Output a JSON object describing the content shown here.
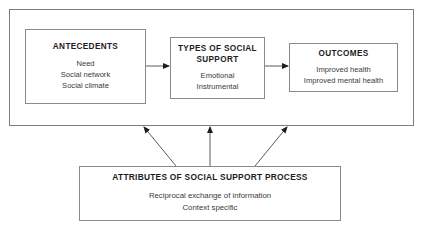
{
  "diagram": {
    "line_color": "#8a8a8a",
    "text_color": "#2b2b2b",
    "background": "#ffffff",
    "outer_container": {
      "label": "outer-frame"
    },
    "boxes": [
      {
        "id": "antecedents",
        "title": "ANTECEDENTS",
        "lines": [
          "Need",
          "Social network",
          "Social climate"
        ]
      },
      {
        "id": "types-of-social-support",
        "title": "TYPES OF SOCIAL SUPPORT",
        "title_line1": "TYPES OF SOCIAL",
        "title_line2": "SUPPORT",
        "lines": [
          "Emotional",
          "Instrumental"
        ]
      },
      {
        "id": "outcomes",
        "title": "OUTCOMES",
        "lines": [
          "Improved health",
          "Improved mental health"
        ]
      },
      {
        "id": "attributes-of-social-support-process",
        "title": "ATTRIBUTES OF SOCIAL SUPPORT PROCESS",
        "lines": [
          "Reciprocal exchange of information",
          "Context specific"
        ]
      }
    ],
    "arrows": [
      {
        "id": "antecedents-to-types",
        "from": "antecedents",
        "to": "types-of-social-support",
        "style": "horizontal"
      },
      {
        "id": "types-to-outcomes",
        "from": "types-of-social-support",
        "to": "outcomes",
        "style": "horizontal"
      },
      {
        "id": "attributes-to-frame-left",
        "from": "attributes-of-social-support-process",
        "to": "outer-frame",
        "style": "diagonal-up-left"
      },
      {
        "id": "attributes-to-frame-center",
        "from": "attributes-of-social-support-process",
        "to": "outer-frame",
        "style": "vertical-up"
      },
      {
        "id": "attributes-to-frame-right",
        "from": "attributes-of-social-support-process",
        "to": "outer-frame",
        "style": "diagonal-up-right"
      }
    ]
  }
}
